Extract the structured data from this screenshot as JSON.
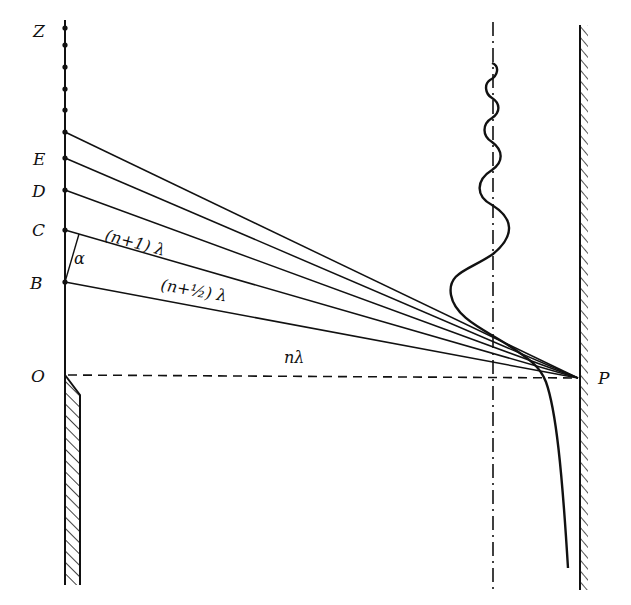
{
  "figure": {
    "type": "diffraction-geometry",
    "points": {
      "Z": "Z",
      "E": "E",
      "D": "D",
      "C": "C",
      "B": "B",
      "O": "O",
      "P": "P"
    },
    "path_labels": {
      "n_plus_one": "(n+1) λ",
      "n_plus_half": "(n+½) λ",
      "n": "nλ"
    },
    "angle_label": "α",
    "colors": {
      "ink": "#111111",
      "background": "#ffffff"
    }
  }
}
